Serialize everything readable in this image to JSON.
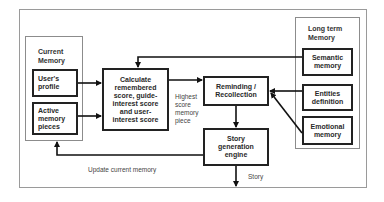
{
  "diagram": {
    "groups": {
      "current_memory": {
        "title": "Current Memory"
      },
      "long_term_memory": {
        "title": "Long term Memory"
      }
    },
    "nodes": {
      "users_profile": "User's profile",
      "active_memory": "Active memory pieces",
      "calculate": "Calculate remembered score, guide-interest score and user-interest score",
      "reminding": "Reminding / Recollection",
      "story_engine": "Story generation engine",
      "semantic": "Semantic memory",
      "entities": "Entities definition",
      "emotional": "Emotional memory"
    },
    "edge_labels": {
      "highest": "Highest score memory piece",
      "update": "Update current memory",
      "story": "Story"
    },
    "edges": [
      {
        "from": "users_profile",
        "to": "calculate"
      },
      {
        "from": "active_memory",
        "to": "calculate"
      },
      {
        "from": "semantic",
        "to": "calculate"
      },
      {
        "from": "calculate",
        "to": "reminding",
        "label": "Highest score memory piece"
      },
      {
        "from": "entities",
        "to": "reminding"
      },
      {
        "from": "emotional",
        "to": "reminding"
      },
      {
        "from": "reminding",
        "to": "story_engine"
      },
      {
        "from": "story_engine",
        "to": "current_memory",
        "label": "Update current memory"
      },
      {
        "from": "story_engine",
        "to": "output",
        "label": "Story"
      }
    ]
  }
}
